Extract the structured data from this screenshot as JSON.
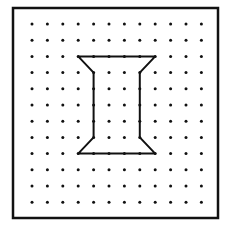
{
  "geoboard": {
    "frame": {
      "x": 13,
      "y": 8,
      "width": 205,
      "height": 210,
      "stroke": "#111111",
      "stroke_width": 2.5
    },
    "grid": {
      "columns": 12,
      "rows": 12,
      "origin_x": 32,
      "origin_y": 24,
      "spacing_x": 15.4,
      "spacing_y": 16.2,
      "dot_radius": 1.5,
      "dot_color": "#111111"
    },
    "shape": {
      "name": "i-beam-spool",
      "stroke": "#111111",
      "stroke_width": 2,
      "vertices_grid": [
        [
          3,
          2
        ],
        [
          8,
          2
        ],
        [
          7,
          3
        ],
        [
          7,
          7
        ],
        [
          8,
          8
        ],
        [
          3,
          8
        ],
        [
          4,
          7
        ],
        [
          4,
          3
        ]
      ]
    }
  }
}
